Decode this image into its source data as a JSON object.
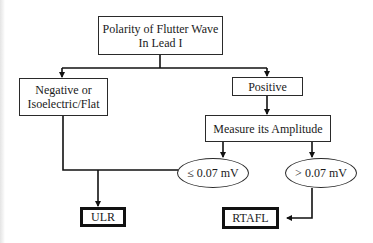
{
  "diagram": {
    "type": "flowchart",
    "root": {
      "label_line1": "Polarity of Flutter Wave",
      "label_line2": "In Lead I"
    },
    "left_branch": {
      "label_line1": "Negative or",
      "label_line2": "Isoelectric/Flat"
    },
    "right_branch": {
      "label": "Positive"
    },
    "measure": {
      "label": "Measure its Amplitude"
    },
    "condition_low": {
      "label": "≤ 0.07 mV"
    },
    "condition_high": {
      "label": "> 0.07 mV"
    },
    "outcome_ulr": {
      "label": "ULR"
    },
    "outcome_rtafl": {
      "label": "RTAFL"
    },
    "edges": [
      [
        "root",
        "left_branch"
      ],
      [
        "root",
        "right_branch"
      ],
      [
        "right_branch",
        "measure"
      ],
      [
        "measure",
        "condition_low"
      ],
      [
        "measure",
        "condition_high"
      ],
      [
        "left_branch",
        "outcome_ulr"
      ],
      [
        "condition_low",
        "outcome_ulr"
      ],
      [
        "condition_high",
        "outcome_rtafl"
      ]
    ]
  }
}
